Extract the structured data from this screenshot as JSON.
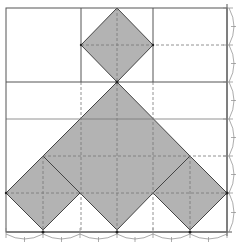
{
  "diagram": {
    "grid_units": 6,
    "colors": {
      "background": "#ffffff",
      "shade": "#b3b3b3",
      "solid_line": "#555555",
      "dashed_line": "#777777",
      "arc_line": "#888888"
    },
    "shapes": [
      {
        "name": "upper-diamond",
        "points": "117,8 153,45 117,82 81,45"
      },
      {
        "name": "central-shape",
        "points": "117,82 190,156 153,193 117,230 80,193 43,156"
      },
      {
        "name": "left-diamond",
        "points": "43,156 80,193 43,230 6,193"
      },
      {
        "name": "right-diamond",
        "points": "190,156 227,193 190,230 153,193"
      }
    ],
    "ticks_bottom": [
      6,
      43,
      80,
      117,
      153,
      190,
      227
    ],
    "ticks_right": [
      8,
      45,
      82,
      119,
      156,
      193,
      232
    ]
  }
}
